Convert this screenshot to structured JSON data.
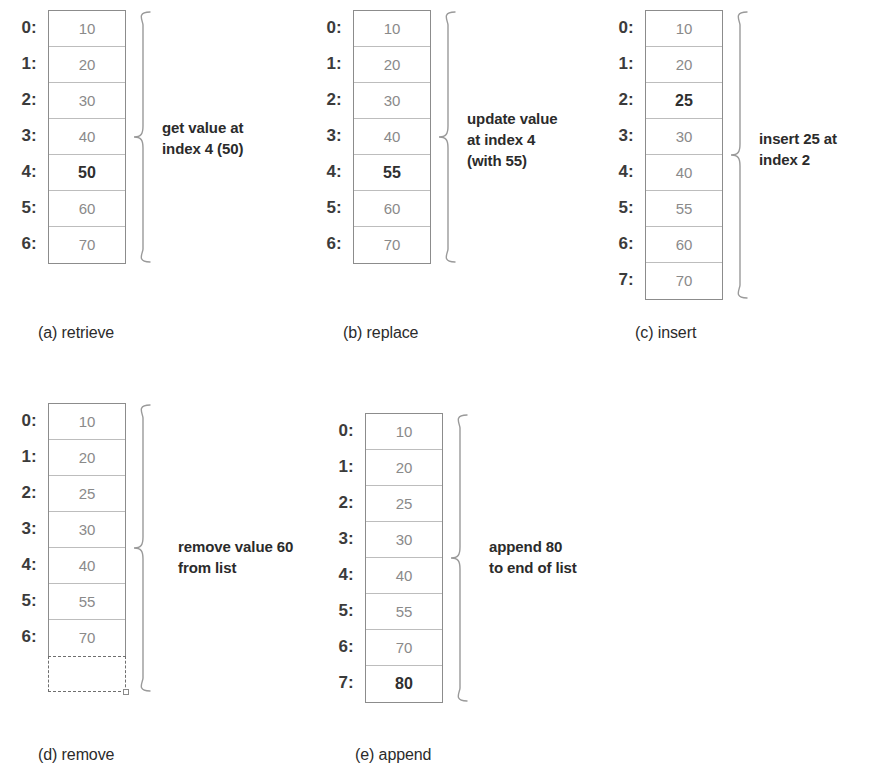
{
  "figure": {
    "colors": {
      "cell_border": "#bdbdbd",
      "table_border": "#8c8c8c",
      "value_text": "#8a8a8a",
      "highlight_text": "#2f2f2f",
      "index_text": "#3b3b3b",
      "note_text": "#2b2b2b"
    }
  },
  "panels": [
    {
      "id": "retrieve",
      "caption": "(a) retrieve",
      "note": "get value at\nindex 4 (50)",
      "indices": [
        "0:",
        "1:",
        "2:",
        "3:",
        "4:",
        "5:",
        "6:"
      ],
      "values": [
        "10",
        "20",
        "30",
        "40",
        "50",
        "60",
        "70"
      ],
      "highlight_index": 4,
      "has_empty_cell": false
    },
    {
      "id": "replace",
      "caption": "(b) replace",
      "note": "update value\nat index 4\n(with 55)",
      "indices": [
        "0:",
        "1:",
        "2:",
        "3:",
        "4:",
        "5:",
        "6:"
      ],
      "values": [
        "10",
        "20",
        "30",
        "40",
        "55",
        "60",
        "70"
      ],
      "highlight_index": 4,
      "has_empty_cell": false
    },
    {
      "id": "insert",
      "caption": "(c) insert",
      "note": "insert 25 at\nindex 2",
      "indices": [
        "0:",
        "1:",
        "2:",
        "3:",
        "4:",
        "5:",
        "6:",
        "7:"
      ],
      "values": [
        "10",
        "20",
        "25",
        "30",
        "40",
        "55",
        "60",
        "70"
      ],
      "highlight_index": 2,
      "has_empty_cell": false
    },
    {
      "id": "remove",
      "caption": "(d) remove",
      "note": "remove value 60\nfrom list",
      "indices": [
        "0:",
        "1:",
        "2:",
        "3:",
        "4:",
        "5:",
        "6:"
      ],
      "values": [
        "10",
        "20",
        "25",
        "30",
        "40",
        "55",
        "70"
      ],
      "highlight_index": -1,
      "has_empty_cell": true
    },
    {
      "id": "append",
      "caption": "(e) append",
      "note": "append 80\nto end of list",
      "indices": [
        "0:",
        "1:",
        "2:",
        "3:",
        "4:",
        "5:",
        "6:",
        "7:"
      ],
      "values": [
        "10",
        "20",
        "25",
        "30",
        "40",
        "55",
        "70",
        "80"
      ],
      "highlight_index": 7,
      "has_empty_cell": false
    }
  ],
  "layout": [
    {
      "left": 0,
      "top": 10,
      "note_left": 162,
      "note_top": 117,
      "caption_left": 38,
      "caption_top": 324
    },
    {
      "left": 305,
      "top": 10,
      "note_left": 467,
      "note_top": 108,
      "caption_left": 343,
      "caption_top": 324
    },
    {
      "left": 597,
      "top": 10,
      "note_left": 759,
      "note_top": 128,
      "caption_left": 635,
      "caption_top": 324
    },
    {
      "left": 0,
      "top": 403,
      "note_left": 178,
      "note_top": 536,
      "caption_left": 38,
      "caption_top": 746
    },
    {
      "left": 317,
      "top": 413,
      "note_left": 489,
      "note_top": 536,
      "caption_left": 355,
      "caption_top": 746
    }
  ]
}
